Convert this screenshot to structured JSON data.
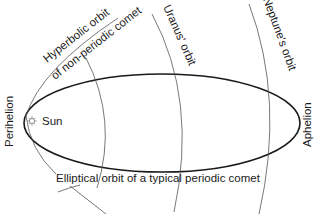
{
  "diagram": {
    "labels": {
      "perihelion": "Perihelion",
      "aphelion": "Aphelion",
      "sun": "Sun",
      "hyperbolic_line1": "Hyperbolic orbit",
      "hyperbolic_line2": "of non-periodic comet",
      "uranus": "Uranus' orbit",
      "neptune": "Neptune's orbit",
      "elliptical": "Elliptical orbit of a typical periodic comet"
    },
    "icons": {
      "sun": "sun-icon"
    },
    "colors": {
      "line": "#1a1a1a",
      "thin_line": "#555555",
      "background": "#ffffff"
    }
  }
}
